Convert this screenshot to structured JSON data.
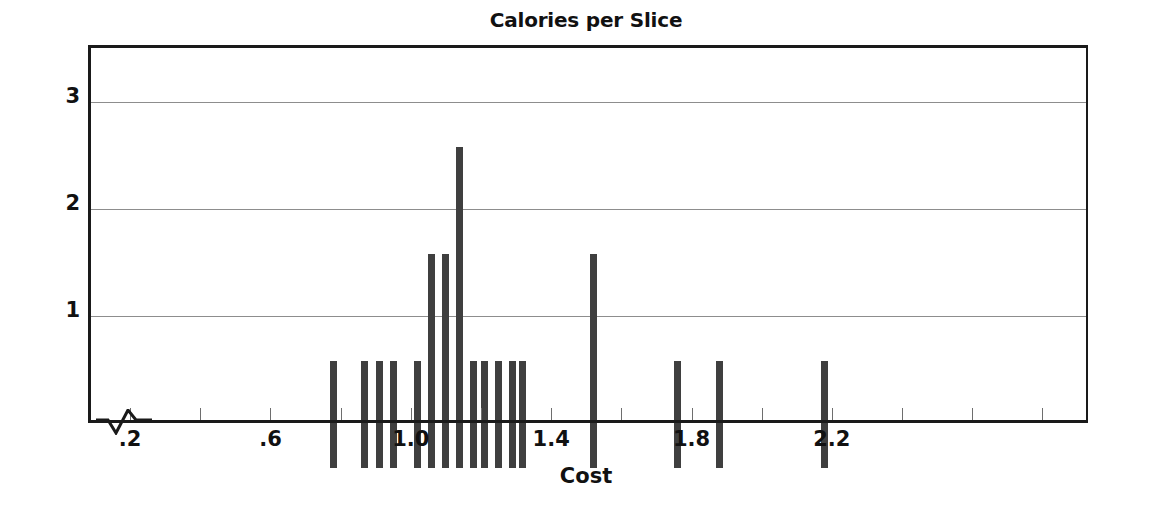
{
  "chart_data": {
    "type": "bar",
    "title": "Calories per Slice",
    "xlabel": "Cost",
    "ylabel": "Frequency",
    "xlim": [
      0.08,
      2.93
    ],
    "ylim": [
      0,
      3.5
    ],
    "grid": true,
    "legend": null,
    "axis_break": true,
    "x_ticks_labeled": [
      ".2",
      ".6",
      "1.0",
      "1.4",
      "1.8",
      "2.2"
    ],
    "x_tick_values_labeled": [
      0.2,
      0.6,
      1.0,
      1.4,
      1.8,
      2.2
    ],
    "x_ticks_minor_values": [
      0.4,
      0.8,
      1.2,
      1.6,
      2.0,
      2.4,
      2.6,
      2.8
    ],
    "y_ticks": [
      "1",
      "2",
      "3"
    ],
    "y_tick_values": [
      1,
      2,
      3
    ],
    "bar_color": "#3f3f3f",
    "categories": [
      "0.52",
      "0.61",
      "0.65",
      "0.69",
      "0.76",
      "0.80",
      "0.84",
      "0.88",
      "0.92",
      "0.95",
      "0.99",
      "1.03",
      "1.06",
      "1.26",
      "1.50",
      "1.62",
      "1.92"
    ],
    "values": [
      1,
      1,
      1,
      1,
      1,
      2,
      2,
      3,
      1,
      1,
      1,
      1,
      1,
      2,
      1,
      1,
      1
    ],
    "bars": [
      {
        "x": 0.52,
        "frequency": 1
      },
      {
        "x": 0.61,
        "frequency": 1
      },
      {
        "x": 0.65,
        "frequency": 1
      },
      {
        "x": 0.69,
        "frequency": 1
      },
      {
        "x": 0.76,
        "frequency": 1
      },
      {
        "x": 0.8,
        "frequency": 2
      },
      {
        "x": 0.84,
        "frequency": 2
      },
      {
        "x": 0.88,
        "frequency": 3
      },
      {
        "x": 0.92,
        "frequency": 1
      },
      {
        "x": 0.95,
        "frequency": 1
      },
      {
        "x": 0.99,
        "frequency": 1
      },
      {
        "x": 1.03,
        "frequency": 1
      },
      {
        "x": 1.06,
        "frequency": 1
      },
      {
        "x": 1.26,
        "frequency": 2
      },
      {
        "x": 1.5,
        "frequency": 1
      },
      {
        "x": 1.62,
        "frequency": 1
      },
      {
        "x": 1.92,
        "frequency": 1
      }
    ]
  }
}
